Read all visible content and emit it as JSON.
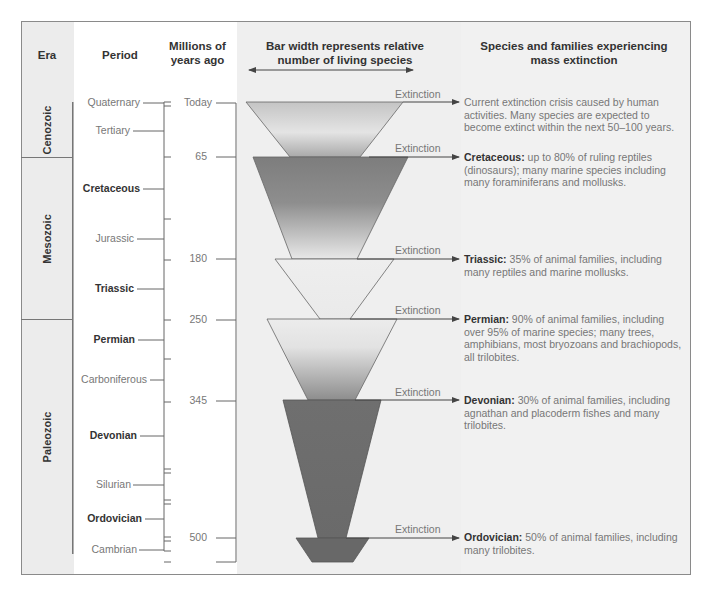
{
  "headers": {
    "era": "Era",
    "period": "Period",
    "years_line1": "Millions of",
    "years_line2": "years ago",
    "bar_line1": "Bar width represents relative",
    "bar_line2": "number of living species",
    "species_line1": "Species and families experiencing",
    "species_line2": "mass extinction"
  },
  "eras": [
    {
      "name": "Cenozoic"
    },
    {
      "name": "Mesozoic"
    },
    {
      "name": "Paleozoic"
    }
  ],
  "periods": [
    {
      "name": "Quaternary",
      "major": false
    },
    {
      "name": "Tertiary",
      "major": false
    },
    {
      "name": "Cretaceous",
      "major": true
    },
    {
      "name": "Jurassic",
      "major": false
    },
    {
      "name": "Triassic",
      "major": true
    },
    {
      "name": "Permian",
      "major": true
    },
    {
      "name": "Carboniferous",
      "major": false
    },
    {
      "name": "Devonian",
      "major": true
    },
    {
      "name": "Silurian",
      "major": false
    },
    {
      "name": "Ordovician",
      "major": true
    },
    {
      "name": "Cambrian",
      "major": false
    }
  ],
  "years": [
    "Today",
    "65",
    "180",
    "250",
    "345",
    "500"
  ],
  "extinction_label": "Extinction",
  "extinctions": [
    {
      "bold": "",
      "text": "Current extinction crisis caused by human activities. Many species are expected to become extinct within the next 50–100 years."
    },
    {
      "bold": "Cretaceous:",
      "text": " up to 80% of ruling reptiles (dinosaurs); many marine species including many foraminiferans and mollusks."
    },
    {
      "bold": "Triassic:",
      "text": " 35% of animal families, including many reptiles and marine mollusks."
    },
    {
      "bold": "Permian:",
      "text": " 90% of animal families, including over 95% of marine species; many trees, amphibians, most bryozoans and brachiopods, all trilobites."
    },
    {
      "bold": "Devonian:",
      "text": " 30% of animal families, including agnathan and placoderm fishes and many trilobites."
    },
    {
      "bold": "Ordovician:",
      "text": " 50% of animal families, including many trilobites."
    }
  ],
  "colors": {
    "frame_border": "#8a8a8a",
    "era_bg": "#ececec",
    "funnel_dark": "#6b6b6b",
    "funnel_light": "#e6e6e6",
    "line": "#555555"
  }
}
